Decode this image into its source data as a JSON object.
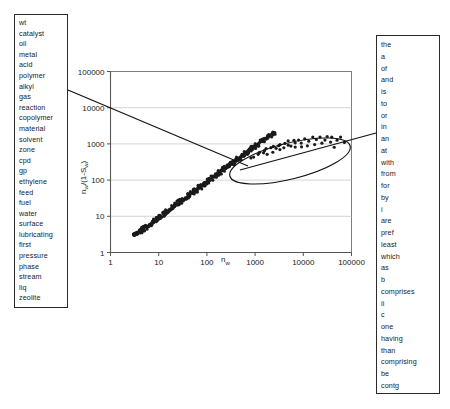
{
  "left_panel": {
    "name": "content-term-list",
    "terms": [
      "wt",
      "catalyst",
      "oil",
      "metal",
      "acid",
      "polymer",
      "alkyl",
      "gas",
      "reaction",
      "copolymer",
      "material",
      "solvent",
      "zone",
      "cpd",
      "gp",
      "ethylene",
      "feed",
      "fuel",
      "water",
      "surface",
      "lubricating",
      "first",
      "pressure",
      "phase",
      "stream",
      "liq",
      "zeolite"
    ]
  },
  "right_panel": {
    "name": "function-term-list",
    "terms": [
      "the",
      "a",
      "of",
      "and",
      "is",
      "to",
      "or",
      "in",
      "an",
      "at",
      "with",
      "from",
      "for",
      "by",
      "i",
      "are",
      "pref",
      "least",
      "which",
      "as",
      "b",
      "comprises",
      "ii",
      "c",
      "one",
      "having",
      "than",
      "comprising",
      "be",
      "contg",
      "equivalent",
      "abstract",
      "has"
    ]
  },
  "chart_data": {
    "type": "scatter",
    "title": "",
    "xlabel": "n_w",
    "xlabel_base": "n",
    "xlabel_sub": "w",
    "ylabel": "n_w/(1-S_w)",
    "ylabel_parts": [
      "n",
      "w",
      "/(1-S",
      "w",
      ")"
    ],
    "xscale": "log",
    "yscale": "log",
    "xlim": [
      1,
      100000
    ],
    "ylim": [
      1,
      100000
    ],
    "xticks": [
      "1",
      "10",
      "100",
      "1000",
      "10000",
      "100000"
    ],
    "yticks": [
      "100000",
      "10000",
      "1000",
      "100",
      "10",
      "1"
    ],
    "grid": "horizontal",
    "legend": "none",
    "annotations": [
      {
        "type": "ellipse",
        "label": "highlighted-cluster",
        "cx": 290,
        "cy": 161,
        "rx": 62,
        "ry": 18,
        "rotation": -14
      },
      {
        "type": "leader-line",
        "label": "left-box-to-cluster",
        "x1": 68,
        "y1": 90,
        "x2": 248,
        "y2": 166
      },
      {
        "type": "leader-line",
        "label": "cluster-to-right-box",
        "x1": 240,
        "y1": 170,
        "x2": 376,
        "y2": 133
      }
    ],
    "series": [
      {
        "name": "main-band",
        "description": "dense diagonal band of points on log-log axes",
        "points": [
          [
            3.0,
            3.0
          ],
          [
            3.2,
            3.1
          ],
          [
            3.4,
            3.3
          ],
          [
            3.6,
            3.5
          ],
          [
            3.9,
            3.7
          ],
          [
            4.1,
            3.9
          ],
          [
            4.4,
            4.2
          ],
          [
            4.7,
            4.4
          ],
          [
            5.0,
            4.7
          ],
          [
            5.4,
            5.0
          ],
          [
            5.8,
            5.4
          ],
          [
            6.2,
            5.8
          ],
          [
            6.6,
            6.1
          ],
          [
            7.1,
            6.6
          ],
          [
            7.6,
            7.0
          ],
          [
            8.1,
            7.5
          ],
          [
            8.7,
            8.0
          ],
          [
            9.3,
            8.6
          ],
          [
            10.0,
            9.2
          ],
          [
            10.7,
            9.8
          ],
          [
            11.4,
            10.5
          ],
          [
            12.2,
            11.2
          ],
          [
            13.1,
            12.0
          ],
          [
            14.0,
            12.8
          ],
          [
            15.0,
            13.7
          ],
          [
            16.1,
            14.7
          ],
          [
            17.2,
            15.7
          ],
          [
            18.4,
            16.8
          ],
          [
            19.7,
            18.0
          ],
          [
            21.1,
            19.2
          ],
          [
            22.6,
            20.6
          ],
          [
            24.2,
            22.0
          ],
          [
            25.9,
            23.5
          ],
          [
            27.7,
            25.2
          ],
          [
            29.6,
            26.9
          ],
          [
            31.7,
            28.8
          ],
          [
            33.9,
            30.8
          ],
          [
            36.3,
            32.9
          ],
          [
            38.9,
            35.2
          ],
          [
            41.6,
            37.7
          ],
          [
            44.5,
            40.3
          ],
          [
            47.6,
            43.1
          ],
          [
            51.0,
            46.1
          ],
          [
            54.6,
            49.3
          ],
          [
            58.4,
            52.7
          ],
          [
            62.5,
            56.4
          ],
          [
            66.9,
            60.3
          ],
          [
            71.6,
            64.5
          ],
          [
            76.7,
            69.0
          ],
          [
            82.1,
            73.8
          ],
          [
            87.8,
            78.9
          ],
          [
            94.0,
            84.4
          ],
          [
            100.6,
            90.3
          ],
          [
            107.7,
            96.5
          ],
          [
            115.3,
            103.2
          ],
          [
            123.4,
            110.4
          ],
          [
            132.1,
            118.0
          ],
          [
            141.4,
            126.2
          ],
          [
            151.4,
            134.9
          ],
          [
            162.0,
            144.2
          ],
          [
            173.4,
            154.2
          ],
          [
            185.6,
            164.8
          ],
          [
            198.7,
            176.2
          ],
          [
            212.7,
            188.3
          ],
          [
            227.6,
            201.3
          ],
          [
            243.6,
            215.2
          ],
          [
            260.8,
            230.0
          ],
          [
            279.1,
            245.8
          ],
          [
            298.8,
            262.7
          ],
          [
            319.8,
            280.8
          ],
          [
            342.3,
            300.1
          ],
          [
            366.4,
            320.7
          ],
          [
            392.1,
            342.8
          ],
          [
            419.7,
            366.4
          ],
          [
            449.2,
            391.6
          ],
          [
            480.8,
            418.5
          ],
          [
            514.7,
            447.4
          ],
          [
            550.9,
            478.2
          ],
          [
            589.7,
            511.2
          ],
          [
            631.2,
            546.5
          ],
          [
            675.6,
            584.2
          ],
          [
            723.2,
            624.6
          ],
          [
            774.1,
            667.8
          ],
          [
            828.6,
            714.0
          ],
          [
            886.9,
            763.5
          ],
          [
            949.3,
            816.4
          ],
          [
            1016.1,
            873.0
          ],
          [
            1087.6,
            933.6
          ],
          [
            1164.1,
            998.4
          ],
          [
            1246.0,
            1067.7
          ],
          [
            1333.7,
            1141.9
          ],
          [
            1427.7,
            1221.2
          ],
          [
            1528.3,
            1306.1
          ],
          [
            1636.0,
            1396.9
          ],
          [
            1751.3,
            1494.0
          ],
          [
            1874.7,
            1597.8
          ],
          [
            2006.7,
            1708.7
          ],
          [
            2148.1,
            1827.4
          ],
          [
            2299.3,
            1954.3
          ],
          [
            2461.3,
            2090.0
          ]
        ]
      },
      {
        "name": "upper-cluster",
        "description": "scattered points inside the annotated ellipse, above the band",
        "points": [
          [
            820,
            430
          ],
          [
            950,
            470
          ],
          [
            1100,
            520
          ],
          [
            1250,
            560
          ],
          [
            1400,
            610
          ],
          [
            1600,
            640
          ],
          [
            1750,
            700
          ],
          [
            1900,
            560
          ],
          [
            2100,
            760
          ],
          [
            2300,
            620
          ],
          [
            2500,
            820
          ],
          [
            2700,
            690
          ],
          [
            3000,
            900
          ],
          [
            3200,
            740
          ],
          [
            3500,
            980
          ],
          [
            3800,
            800
          ],
          [
            4200,
            1060
          ],
          [
            4600,
            870
          ],
          [
            5000,
            1150
          ],
          [
            5500,
            930
          ],
          [
            6000,
            1220
          ],
          [
            6600,
            760
          ],
          [
            7200,
            1000
          ],
          [
            8000,
            1300
          ],
          [
            8800,
            820
          ],
          [
            9600,
            1080
          ],
          [
            11000,
            1400
          ],
          [
            12000,
            900
          ],
          [
            13500,
            1150
          ],
          [
            15000,
            1480
          ],
          [
            17000,
            980
          ],
          [
            19000,
            1260
          ],
          [
            22000,
            1560
          ],
          [
            25000,
            1050
          ],
          [
            28000,
            1340
          ],
          [
            32000,
            1640
          ],
          [
            36000,
            1120
          ],
          [
            41000,
            1420
          ],
          [
            46000,
            880
          ],
          [
            52000,
            1200
          ],
          [
            60000,
            1500
          ],
          [
            68000,
            1020
          ]
        ]
      }
    ]
  }
}
